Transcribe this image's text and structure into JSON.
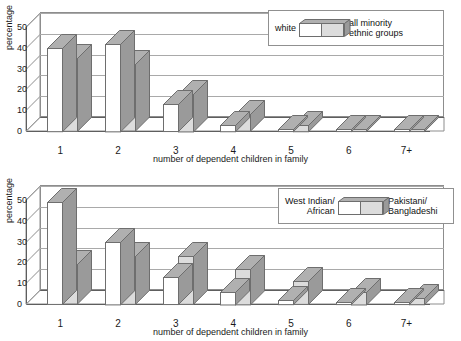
{
  "chart_data": [
    {
      "type": "bar",
      "title": "",
      "xlabel": "number of dependent children in family",
      "ylabel": "percentage",
      "categories": [
        "1",
        "2",
        "3",
        "4",
        "5",
        "6",
        "7+"
      ],
      "yticks": [
        0,
        10,
        20,
        30,
        40,
        50
      ],
      "ylim": [
        0,
        50
      ],
      "grid": true,
      "legend_position": "top-right",
      "series": [
        {
          "name": "white",
          "values": [
            40,
            42,
            13,
            3,
            1,
            1,
            1
          ]
        },
        {
          "name": "all minority\nethnic groups",
          "values": [
            35,
            32,
            18,
            8,
            3,
            1,
            1
          ]
        }
      ]
    },
    {
      "type": "bar",
      "title": "",
      "xlabel": "number of dependent children in family",
      "ylabel": "percentage",
      "categories": [
        "1",
        "2",
        "3",
        "4",
        "5",
        "6",
        "7+"
      ],
      "yticks": [
        0,
        10,
        20,
        30,
        40,
        50
      ],
      "ylim": [
        0,
        50
      ],
      "grid": true,
      "legend_position": "top-right",
      "series": [
        {
          "name": "West Indian/\nAfrican",
          "values": [
            49,
            30,
            13,
            6,
            2,
            1,
            1
          ]
        },
        {
          "name": "Pakistani/\nBangladeshi",
          "values": [
            19,
            23,
            23,
            17,
            11,
            6,
            3
          ]
        }
      ]
    }
  ],
  "charts": [
    {
      "id": "chart-top",
      "ylabel": "percentage",
      "xlabel": "number of dependent children in family",
      "yticks": [
        "50",
        "40",
        "30",
        "20",
        "10",
        "0"
      ],
      "xticks": [
        "1",
        "2",
        "3",
        "4",
        "5",
        "6",
        "7+"
      ],
      "legend": {
        "left_label": "white",
        "right_label": "all minority\nethnic groups"
      }
    },
    {
      "id": "chart-bottom",
      "ylabel": "percentage",
      "xlabel": "number of dependent children in family",
      "yticks": [
        "50",
        "40",
        "30",
        "20",
        "10",
        "0"
      ],
      "xticks": [
        "1",
        "2",
        "3",
        "4",
        "5",
        "6",
        "7+"
      ],
      "legend": {
        "left_label": "West Indian/\nAfrican",
        "right_label": "Pakistani/\nBangladeshi"
      }
    }
  ],
  "colors": {
    "series_white": "#ffffff",
    "series_grey": "#dcdcdc",
    "bar_outline": "#6e6e6e",
    "bar_top_shade": "#b0b0b0",
    "bar_side_shade": "#9a9a9a",
    "grid": "#a9a9a9",
    "axis": "#5e5e5e",
    "text": "#1a1a1a"
  }
}
